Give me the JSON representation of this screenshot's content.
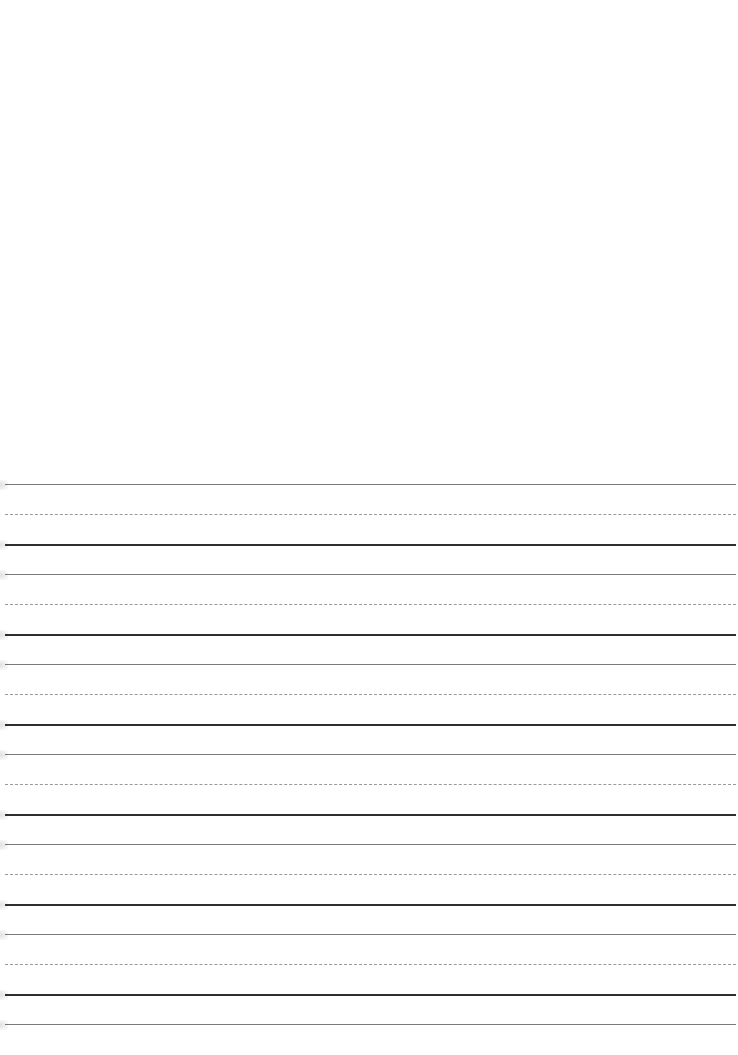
{
  "document": {
    "type": "handwriting practice sheet",
    "blank_top_area": true,
    "line_groups": [
      {
        "top": 484,
        "mid": 514,
        "base": 544
      },
      {
        "top": 574,
        "mid": 604,
        "base": 634
      },
      {
        "top": 664,
        "mid": 694,
        "base": 724
      },
      {
        "top": 754,
        "mid": 784,
        "base": 814
      },
      {
        "top": 844,
        "mid": 874,
        "base": 904
      },
      {
        "top": 934,
        "mid": 964,
        "base": 994
      }
    ],
    "final_top_line": 1024,
    "colors": {
      "top_line": "#7a7a7a",
      "mid_dashed_line": "#9a9a9a",
      "baseline": "#2e2e2e",
      "paper": "#ffffff"
    }
  }
}
